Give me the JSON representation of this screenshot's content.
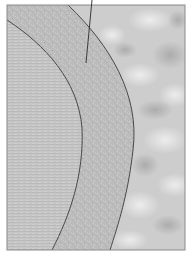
{
  "figure": {
    "regions": [
      {
        "name": "inner-layer",
        "texture": "fine horizontal striations",
        "fill": "#c4c4c4"
      },
      {
        "name": "middle-layer",
        "texture": "granular speckle",
        "fill": "#bdbdbd"
      },
      {
        "name": "outer-layer",
        "texture": "cloudy mottled",
        "fill": "#d2d2d2"
      }
    ],
    "colors": {
      "frame": "#8a8a8a",
      "boundary": "#3a3a3a",
      "leader": "#2a2a2a",
      "background": "#ffffff"
    },
    "leader_label": ""
  }
}
